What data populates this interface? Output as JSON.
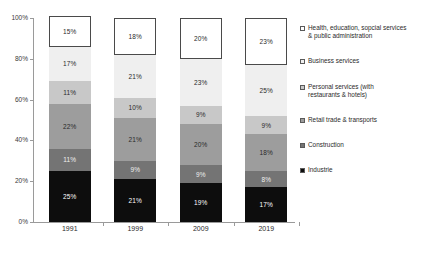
{
  "chart_data": {
    "type": "bar",
    "subtype": "stacked-percentage",
    "title": "",
    "xlabel": "",
    "ylabel": "",
    "categories": [
      "1991",
      "1999",
      "2009",
      "2019"
    ],
    "ylim": [
      0,
      100
    ],
    "ytick_labels": [
      "0%",
      "20%",
      "40%",
      "60%",
      "80%",
      "100%"
    ],
    "ytick_values": [
      0,
      20,
      40,
      60,
      80,
      100
    ],
    "grid": false,
    "legend_position": "right",
    "series": [
      {
        "name": "Industrie",
        "color": "#0d0d0d",
        "label_color": "#ffffff",
        "values": [
          25,
          21,
          19,
          17
        ],
        "labels": [
          "25%",
          "21%",
          "19%",
          "17%"
        ]
      },
      {
        "name": "Construction",
        "color": "#747474",
        "label_color": "#f0f0f0",
        "values": [
          11,
          9,
          9,
          8
        ],
        "labels": [
          "11%",
          "9%",
          "9%",
          "8%"
        ]
      },
      {
        "name": "Retail trade & transports",
        "color": "#9d9d9d",
        "label_color": "#2a2a2a",
        "values": [
          22,
          21,
          20,
          18
        ],
        "labels": [
          "22%",
          "21%",
          "20%",
          "18%"
        ]
      },
      {
        "name": "Personal services (with\nrestaurants & hotels)",
        "color": "#c8c8c8",
        "label_color": "#2a2a2a",
        "values": [
          11,
          10,
          9,
          9
        ],
        "labels": [
          "11%",
          "10%",
          "9%",
          "9%"
        ]
      },
      {
        "name": "Business services",
        "color": "#efefef",
        "label_color": "#2a2a2a",
        "values": [
          17,
          21,
          23,
          25
        ],
        "labels": [
          "17%",
          "21%",
          "23%",
          "25%"
        ]
      },
      {
        "name": "Health, education, sopcial services\n& public administration",
        "color": "#ffffff",
        "label_color": "#2a2a2a",
        "values": [
          15,
          18,
          20,
          23
        ],
        "labels": [
          "15%",
          "18%",
          "20%",
          "23%"
        ]
      }
    ]
  }
}
